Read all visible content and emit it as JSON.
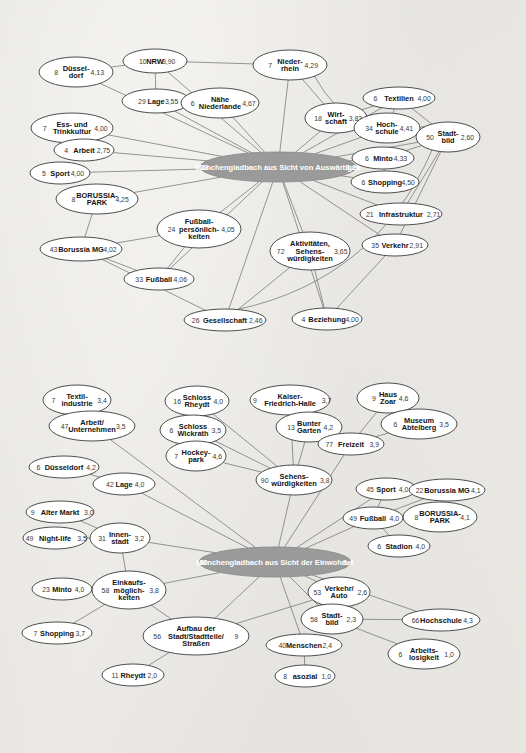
{
  "figure": {
    "type": "network-diagram",
    "background_color": "#efeeea",
    "node_fill": "#ffffff",
    "node_stroke": "#3b3b3b",
    "hub_fill": "#9a9a9a",
    "hub_text_color": "#ffffff",
    "edge_color": "#6f6f6f",
    "decimal_separator": ","
  },
  "chart_data": {
    "type": "diagram",
    "title": "",
    "networks": [
      {
        "id": "auswaertige",
        "hub": {
          "count": "33",
          "label": "Mönchengladbach aus Sicht von Auswärtigen",
          "value": "3,21"
        },
        "nodes": [
          {
            "id": "duesseldorf",
            "count": "8",
            "label": "Düssel-\ndorf",
            "value": "4,13"
          },
          {
            "id": "nrw",
            "count": "10",
            "label": "NRW",
            "value": "3,90"
          },
          {
            "id": "niederrhein",
            "count": "7",
            "label": "Nieder-\nrhein",
            "value": "4,29"
          },
          {
            "id": "lage",
            "count": "29",
            "label": "Lage",
            "value": "3,55"
          },
          {
            "id": "naehe_nl",
            "count": "6",
            "label": "Nähe\nNiederlande",
            "value": "4,67"
          },
          {
            "id": "wirtschaft",
            "count": "18",
            "label": "Wirt-\nschaft",
            "value": "3,83"
          },
          {
            "id": "textilien",
            "count": "6",
            "label": "Textilien",
            "value": "4,00"
          },
          {
            "id": "esskultur",
            "count": "7",
            "label": "Ess- und\nTrinkkultur",
            "value": "4,00"
          },
          {
            "id": "hochschule",
            "count": "34",
            "label": "Hoch-\nschule",
            "value": "4,41"
          },
          {
            "id": "stadtbild",
            "count": "50",
            "label": "Stadt-\nbild",
            "value": "2,60"
          },
          {
            "id": "arbeit",
            "count": "4",
            "label": "Arbeit",
            "value": "2,75"
          },
          {
            "id": "minto",
            "count": "6",
            "label": "Minto",
            "value": "4,33"
          },
          {
            "id": "sport",
            "count": "5",
            "label": "Sport",
            "value": "4,00"
          },
          {
            "id": "shopping",
            "count": "6",
            "label": "Shopping",
            "value": "4,50"
          },
          {
            "id": "borussiapark",
            "count": "8",
            "label": "BORUSSIA-\nPARK",
            "value": "4,25"
          },
          {
            "id": "fussballpers",
            "count": "24",
            "label": "Fußball-\npersönlich-\nkeiten",
            "value": "4,05"
          },
          {
            "id": "infrastruktur",
            "count": "21",
            "label": "Infrastruktur",
            "value": "2,71"
          },
          {
            "id": "borussiamg",
            "count": "43",
            "label": "Borussia MG",
            "value": "4,02"
          },
          {
            "id": "aktivitaeten",
            "count": "72",
            "label": "Aktivitäten,\nSehens-\nwürdigkeiten",
            "value": "3,65"
          },
          {
            "id": "verkehr",
            "count": "35",
            "label": "Verkehr",
            "value": "2,91"
          },
          {
            "id": "fussball",
            "count": "33",
            "label": "Fußball",
            "value": "4,06"
          },
          {
            "id": "gesellschaft",
            "count": "26",
            "label": "Gesellschaft",
            "value": "2,46"
          },
          {
            "id": "beziehung",
            "count": "4",
            "label": "Beziehung",
            "value": "4,00"
          }
        ]
      },
      {
        "id": "einwohner",
        "hub": {
          "count": "30",
          "label": "Mönchengladbach aus Sicht der Einwohner",
          "value": "3,4"
        },
        "nodes": [
          {
            "id": "textilindustrie",
            "count": "7",
            "label": "Textil-\nindustrie",
            "value": "3,4"
          },
          {
            "id": "schlossrheydt",
            "count": "16",
            "label": "Schloss\nRheydt",
            "value": "4,0"
          },
          {
            "id": "kaiserfriedrich",
            "count": "9",
            "label": "Kaiser-\nFriedrich-Halle",
            "value": "3,7"
          },
          {
            "id": "hauszoar",
            "count": "9",
            "label": "Haus\nZoar",
            "value": "4,6"
          },
          {
            "id": "arbeit_unt",
            "count": "47",
            "label": "Arbeit/\nUnternehmen",
            "value": "3,5"
          },
          {
            "id": "schlosswickrath",
            "count": "6",
            "label": "Schloss\nWickrath",
            "value": "3,5"
          },
          {
            "id": "buntergarten",
            "count": "13",
            "label": "Bunter\nGarten",
            "value": "4,2"
          },
          {
            "id": "museum",
            "count": "6",
            "label": "Museum\nAbteiberg",
            "value": "3,5"
          },
          {
            "id": "hockeypark",
            "count": "7",
            "label": "Hockey-\npark",
            "value": "4,6"
          },
          {
            "id": "freizeit",
            "count": "77",
            "label": "Freizeit",
            "value": "3,9"
          },
          {
            "id": "duesseldorf2",
            "count": "6",
            "label": "Düsseldorf",
            "value": "4,2"
          },
          {
            "id": "lage2",
            "count": "42",
            "label": "Lage",
            "value": "4,0"
          },
          {
            "id": "sehenswuerd",
            "count": "90",
            "label": "Sehens-\nwürdigkeiten",
            "value": "3,8"
          },
          {
            "id": "sport2",
            "count": "45",
            "label": "Sport",
            "value": "4,0"
          },
          {
            "id": "borussiamg2",
            "count": "22",
            "label": "Borussia MG",
            "value": "4,1"
          },
          {
            "id": "altermarkt",
            "count": "9",
            "label": "Alter Markt",
            "value": "3,0"
          },
          {
            "id": "fussball2",
            "count": "49",
            "label": "Fußball",
            "value": "4,0"
          },
          {
            "id": "borussiapark2",
            "count": "8",
            "label": "BORUSSIA-\nPARK",
            "value": "4,1"
          },
          {
            "id": "nightlife",
            "count": "49",
            "label": "Night-life",
            "value": "3,5"
          },
          {
            "id": "innenstadt",
            "count": "31",
            "label": "Innen-\nstadt",
            "value": "3,2"
          },
          {
            "id": "stadion",
            "count": "6",
            "label": "Stadion",
            "value": "4,0"
          },
          {
            "id": "minto2",
            "count": "23",
            "label": "Minto",
            "value": "4,0"
          },
          {
            "id": "einkauf",
            "count": "58",
            "label": "Einkaufs-\nmöglich-\nkeiten",
            "value": "3,8"
          },
          {
            "id": "verkehrauto",
            "count": "53",
            "label": "Verkehr/\nAuto",
            "value": "2,6"
          },
          {
            "id": "stadtbild2",
            "count": "58",
            "label": "Stadt-\nbild",
            "value": "2,3"
          },
          {
            "id": "hochschule2",
            "count": "66",
            "label": "Hochschule",
            "value": "4,3"
          },
          {
            "id": "shopping2",
            "count": "7",
            "label": "Shopping",
            "value": "3,7"
          },
          {
            "id": "aufbau",
            "count": "56",
            "label": "Aufbau der\nStadt/Stadtteile/\nStraßen",
            "value": "9"
          },
          {
            "id": "menschen",
            "count": "40",
            "label": "Menschen",
            "value": "2,4"
          },
          {
            "id": "arbeitslos",
            "count": "6",
            "label": "Arbeits-\nlosigkeit",
            "value": "1,0"
          },
          {
            "id": "rheydt",
            "count": "11",
            "label": "Rheydt",
            "value": "2,0"
          },
          {
            "id": "asozial",
            "count": "8",
            "label": "asozial",
            "value": "1,0"
          }
        ]
      }
    ]
  }
}
